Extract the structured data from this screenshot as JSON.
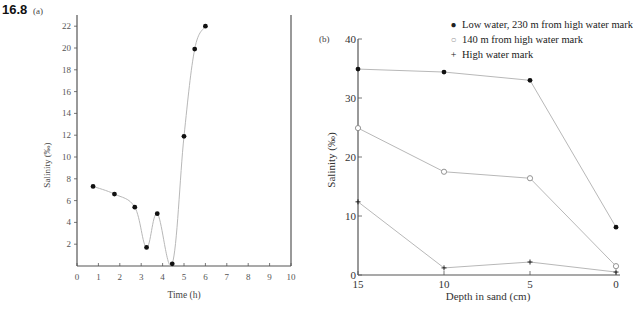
{
  "figure": {
    "number": "16.8",
    "panel_a_label": "(a)",
    "panel_b_label": "(b)"
  },
  "legend": {
    "items": [
      {
        "symbol": "●",
        "label": "Low water, 230 m from high water mark"
      },
      {
        "symbol": "○",
        "label": "140 m from high water mark"
      },
      {
        "symbol": "+",
        "label": "High water mark"
      }
    ]
  },
  "chart_data": [
    {
      "panel": "a",
      "type": "line",
      "title": "",
      "xlabel": "Time (h)",
      "ylabel": "Salinity (‰)",
      "xlim": [
        0,
        10
      ],
      "ylim": [
        0,
        22.5
      ],
      "xticks": [
        0,
        1,
        2,
        3,
        4,
        5,
        6,
        7,
        8,
        9,
        10
      ],
      "yticks": [
        2,
        4,
        6,
        8,
        10,
        12,
        14,
        16,
        18,
        20,
        22
      ],
      "grid": false,
      "series": [
        {
          "name": "Salinity",
          "marker": "filled-circle",
          "x": [
            0.75,
            1.75,
            2.7,
            3.25,
            3.75,
            4.45,
            5.0,
            5.5,
            6.0
          ],
          "values": [
            7.3,
            6.6,
            5.4,
            1.7,
            4.8,
            0.2,
            11.9,
            19.9,
            22.0
          ]
        }
      ]
    },
    {
      "panel": "b",
      "type": "line",
      "title": "",
      "xlabel": "Depth in sand (cm)",
      "ylabel": "Salinity (‰)",
      "xlim": [
        15,
        0
      ],
      "ylim": [
        0,
        40
      ],
      "xticks": [
        15,
        10,
        5,
        0
      ],
      "yticks": [
        0,
        10,
        20,
        30,
        40
      ],
      "grid": false,
      "legend_position": "top-right",
      "categories": [
        15,
        10,
        5,
        0
      ],
      "series": [
        {
          "name": "Low water, 230 m from high water mark",
          "marker": "filled-circle",
          "values": [
            34.9,
            34.4,
            33.0,
            8.1
          ]
        },
        {
          "name": "140 m from high water mark",
          "marker": "open-circle",
          "values": [
            24.9,
            17.5,
            16.4,
            1.5
          ]
        },
        {
          "name": "High water mark",
          "marker": "plus",
          "values": [
            12.4,
            1.2,
            2.2,
            0.5
          ]
        }
      ]
    }
  ],
  "colors": {
    "axis": "#555555",
    "line": "#b8b8b8",
    "marker": "#111111",
    "text": "#222222"
  }
}
